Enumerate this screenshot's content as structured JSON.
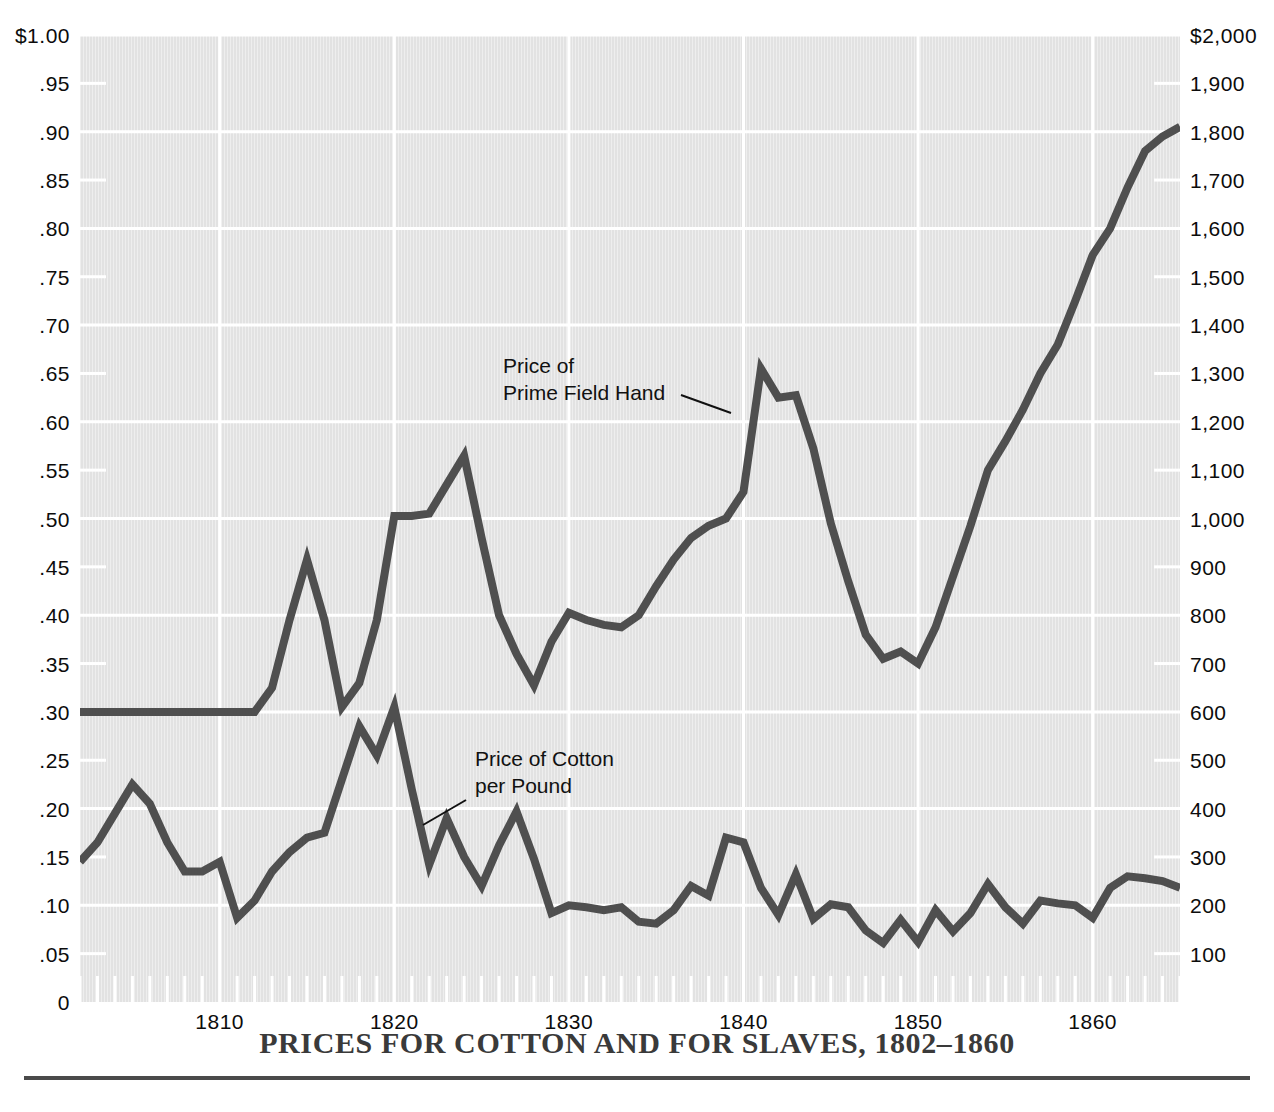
{
  "title": "PRICES FOR COTTON AND FOR SLAVES, 1802–1860",
  "annotations": {
    "slave_line": "Price of\nPrime Field Hand",
    "cotton_line": "Price of Cotton\nper Pound"
  },
  "colors": {
    "line": "#4f4f4f",
    "plot_background": "#e2e2e2",
    "gridline": "#ffffff",
    "title_text": "#3a3a3a",
    "axis_text": "#0c0c0c"
  },
  "axes": {
    "left": {
      "title": "",
      "ticks": [
        "$1.00",
        ".95",
        ".90",
        ".85",
        ".80",
        ".75",
        ".70",
        ".65",
        ".60",
        ".55",
        ".50",
        ".45",
        ".40",
        ".35",
        ".30",
        ".25",
        ".20",
        ".15",
        ".10",
        ".05",
        "0"
      ],
      "values": [
        1.0,
        0.95,
        0.9,
        0.85,
        0.8,
        0.75,
        0.7,
        0.65,
        0.6,
        0.55,
        0.5,
        0.45,
        0.4,
        0.35,
        0.3,
        0.25,
        0.2,
        0.15,
        0.1,
        0.05,
        0.0
      ],
      "range": [
        0,
        1.0
      ]
    },
    "right": {
      "title": "",
      "ticks": [
        "$2,000",
        "1,900",
        "1,800",
        "1,700",
        "1,600",
        "1,500",
        "1,400",
        "1,300",
        "1,200",
        "1,100",
        "1,000",
        "900",
        "800",
        "700",
        "600",
        "500",
        "400",
        "300",
        "200",
        "100"
      ],
      "values": [
        2000,
        1900,
        1800,
        1700,
        1600,
        1500,
        1400,
        1300,
        1200,
        1100,
        1000,
        900,
        800,
        700,
        600,
        500,
        400,
        300,
        200,
        100
      ],
      "range": [
        0,
        2000
      ]
    },
    "bottom": {
      "ticks": [
        "1810",
        "1820",
        "1830",
        "1840",
        "1850",
        "1860"
      ],
      "values": [
        1810,
        1820,
        1830,
        1840,
        1850,
        1860
      ],
      "range": [
        1802,
        1865
      ]
    }
  },
  "chart_data": {
    "type": "line",
    "title": "PRICES FOR COTTON AND FOR SLAVES, 1802–1860",
    "xlabel": "",
    "ylabel": "Price of Cotton per Pound (dollars)",
    "y2label": "Price of Prime Field Hand (dollars)",
    "xlim": [
      1802,
      1865
    ],
    "ylim": [
      0,
      1.0
    ],
    "y2lim": [
      0,
      2000
    ],
    "grid": true,
    "legend": "annotated-inline",
    "x": [
      1802,
      1803,
      1804,
      1805,
      1806,
      1807,
      1808,
      1809,
      1810,
      1811,
      1812,
      1813,
      1814,
      1815,
      1816,
      1817,
      1818,
      1819,
      1820,
      1821,
      1822,
      1823,
      1824,
      1825,
      1826,
      1827,
      1828,
      1829,
      1830,
      1831,
      1832,
      1833,
      1834,
      1835,
      1836,
      1837,
      1838,
      1839,
      1840,
      1841,
      1842,
      1843,
      1844,
      1845,
      1846,
      1847,
      1848,
      1849,
      1850,
      1851,
      1852,
      1853,
      1854,
      1855,
      1856,
      1857,
      1858,
      1859,
      1860,
      1861,
      1862,
      1863,
      1864,
      1865
    ],
    "series": [
      {
        "name": "Price of Prime Field Hand",
        "axis": "right",
        "unit": "dollars",
        "values": [
          600,
          600,
          600,
          600,
          600,
          600,
          600,
          600,
          600,
          600,
          600,
          650,
          790,
          915,
          790,
          610,
          660,
          790,
          1005,
          1005,
          1010,
          1070,
          1130,
          960,
          800,
          720,
          655,
          745,
          805,
          790,
          780,
          775,
          800,
          860,
          915,
          960,
          985,
          1000,
          1055,
          1310,
          1250,
          1255,
          1145,
          990,
          870,
          760,
          710,
          725,
          700,
          775,
          880,
          985,
          1100,
          1160,
          1225,
          1300,
          1360,
          1450,
          1545,
          1600,
          1685,
          1760,
          1790,
          1810
        ]
      },
      {
        "name": "Price of Cotton per Pound",
        "axis": "left",
        "unit": "dollars_per_pound",
        "values": [
          0.145,
          0.165,
          0.195,
          0.225,
          0.205,
          0.165,
          0.135,
          0.135,
          0.145,
          0.087,
          0.105,
          0.135,
          0.155,
          0.17,
          0.175,
          0.23,
          0.285,
          0.255,
          0.305,
          0.22,
          0.142,
          0.19,
          0.15,
          0.12,
          0.162,
          0.197,
          0.148,
          0.092,
          0.1,
          0.098,
          0.095,
          0.098,
          0.083,
          0.081,
          0.095,
          0.12,
          0.11,
          0.17,
          0.165,
          0.118,
          0.09,
          0.132,
          0.086,
          0.101,
          0.098,
          0.074,
          0.061,
          0.085,
          0.062,
          0.095,
          0.073,
          0.092,
          0.122,
          0.098,
          0.081,
          0.105,
          0.102,
          0.1,
          0.087,
          0.118,
          0.13,
          0.128,
          0.125,
          0.118
        ]
      }
    ]
  }
}
